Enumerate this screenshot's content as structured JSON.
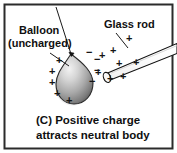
{
  "figure": {
    "type": "physics-diagram",
    "frame_color": "#2b2b2b",
    "background_color": "#ffffff"
  },
  "labels": {
    "balloon_line1": "Balloon",
    "balloon_line2": "(uncharged)",
    "glass_rod": "Glass rod"
  },
  "caption": {
    "line1": "(C)  Positive charge",
    "line2": "attracts neutral body"
  },
  "objects": {
    "balloon": {
      "name": "balloon",
      "shape": "teardrop",
      "fill_light": "#e8e8e8",
      "fill_dark": "#6d6d6d",
      "charge_state": "neutral (polarized)"
    },
    "glass_rod": {
      "name": "glass-rod",
      "shape": "cylinder",
      "fill": "#fdfdfd",
      "charge_state": "positive"
    },
    "thread": {
      "name": "thread",
      "description": "string suspending balloon"
    }
  },
  "charges": {
    "balloon_negative_symbol": "−",
    "balloon_positive_symbol": "+",
    "rod_positive_symbol": "+",
    "balloon_left_positive_count": 5,
    "balloon_right_negative_count": 4,
    "rod_positive_count": 8,
    "negative_signs": [
      {
        "x": 86,
        "y": 52
      },
      {
        "x": 94,
        "y": 59
      },
      {
        "x": 94,
        "y": 70
      },
      {
        "x": 90,
        "y": 80
      }
    ],
    "positive_signs_balloon": [
      {
        "x": 59,
        "y": 60
      },
      {
        "x": 52,
        "y": 71
      },
      {
        "x": 52,
        "y": 82
      },
      {
        "x": 57,
        "y": 93
      },
      {
        "x": 68,
        "y": 100
      }
    ],
    "positive_signs_rod": [
      {
        "x": 103,
        "y": 55
      },
      {
        "x": 99,
        "y": 72
      },
      {
        "x": 110,
        "y": 78
      },
      {
        "x": 123,
        "y": 76
      },
      {
        "x": 112,
        "y": 50
      },
      {
        "x": 128,
        "y": 38
      },
      {
        "x": 135,
        "y": 62
      },
      {
        "x": 118,
        "y": 63
      }
    ]
  }
}
